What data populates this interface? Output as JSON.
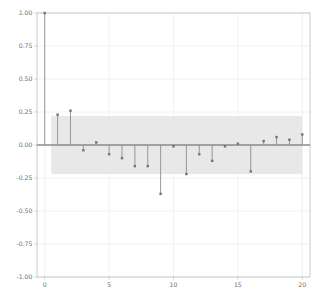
{
  "chart_data": {
    "type": "stem",
    "title": "",
    "subtitle": "",
    "xlabel": "",
    "ylabel": "",
    "x": [
      0,
      1,
      2,
      3,
      4,
      5,
      6,
      7,
      8,
      9,
      10,
      11,
      12,
      13,
      14,
      15,
      16,
      17,
      18,
      19,
      20
    ],
    "values": [
      1.0,
      0.23,
      0.26,
      -0.04,
      0.02,
      -0.07,
      -0.1,
      -0.16,
      -0.16,
      -0.37,
      -0.01,
      -0.22,
      -0.07,
      -0.12,
      -0.01,
      0.01,
      -0.2,
      0.03,
      0.06,
      0.04,
      0.08
    ],
    "series": [
      {
        "name": "autocorrelation",
        "values": [
          1.0,
          0.23,
          0.26,
          -0.04,
          0.02,
          -0.07,
          -0.1,
          -0.16,
          -0.16,
          -0.37,
          -0.01,
          -0.22,
          -0.07,
          -0.12,
          -0.01,
          0.01,
          -0.2,
          0.03,
          0.06,
          0.04,
          0.08
        ]
      }
    ],
    "confidence_band": {
      "upper": 0.22,
      "lower": -0.22,
      "x_start": 0.5,
      "x_end": 20.0,
      "color": "#e8e8e8"
    },
    "xlim": [
      -0.6,
      20.6
    ],
    "ylim": [
      -1.0,
      1.0
    ],
    "xticks": [
      0,
      5,
      10,
      15,
      20
    ],
    "xtick_labels": [
      "0",
      "5",
      "10",
      "15",
      "20"
    ],
    "yticks": [
      1.0,
      0.75,
      0.5,
      0.25,
      0.0,
      -0.25,
      -0.5,
      -0.75,
      -1.0
    ],
    "ytick_labels": [
      "1.00",
      "0.75",
      "0.50",
      "0.25",
      "0.00",
      "-0.25",
      "-0.50",
      "-0.75",
      "-1.00"
    ],
    "grid": true,
    "grid_color": "#ededed",
    "legend": null,
    "legend_position": "none",
    "marker": "square",
    "marker_color": "#737373",
    "stem_color": "#8c8c8c",
    "baseline_color": "#5a5a5a",
    "axis_color": "#c4c4c4",
    "background": "#ffffff"
  }
}
